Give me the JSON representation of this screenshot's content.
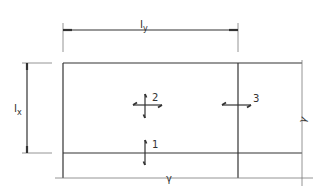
{
  "diagram": {
    "dimensions": {
      "ly_label": "l",
      "ly_sub": "y",
      "lx_label": "l",
      "lx_sub": "x"
    },
    "arrows": [
      {
        "id": "1",
        "label": "1",
        "type": "vertical"
      },
      {
        "id": "2",
        "label": "2",
        "type": "cross"
      },
      {
        "id": "3",
        "label": "3",
        "type": "horizontal"
      }
    ],
    "symbols": {
      "right_edge": "γ",
      "bottom_edge": "γ"
    },
    "colors": {
      "line": "#333333",
      "background": "#ffffff"
    }
  }
}
